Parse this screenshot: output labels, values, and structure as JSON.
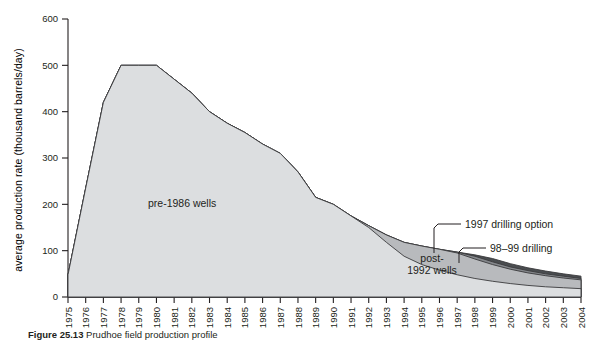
{
  "figure": {
    "caption_bold": "Figure 25.13",
    "caption_rest": "Prudhoe field production profile"
  },
  "chart_data": {
    "type": "area",
    "title": "",
    "xlabel": "",
    "ylabel": "average production rate (thousand barrels/day)",
    "xlim": [
      1975,
      2004
    ],
    "ylim": [
      0,
      600
    ],
    "yticks": [
      0,
      100,
      200,
      300,
      400,
      500,
      600
    ],
    "ytick_labels": [
      "0",
      "100",
      "200",
      "300",
      "400",
      "500",
      "600"
    ],
    "x": [
      1975,
      1976,
      1977,
      1978,
      1979,
      1980,
      1981,
      1982,
      1983,
      1984,
      1985,
      1986,
      1987,
      1988,
      1989,
      1990,
      1991,
      1992,
      1993,
      1994,
      1995,
      1996,
      1997,
      1998,
      1999,
      2000,
      2001,
      2002,
      2003,
      2004
    ],
    "xtick_labels": [
      "1975",
      "1976",
      "1977",
      "1978",
      "1979",
      "1980",
      "1981",
      "1982",
      "1983",
      "1984",
      "1985",
      "1986",
      "1987",
      "1988",
      "1989",
      "1990",
      "1991",
      "1992",
      "1993",
      "1994",
      "1995",
      "1996",
      "1997",
      "1998",
      "1999",
      "2000",
      "2001",
      "2002",
      "2003",
      "2004"
    ],
    "grid": false,
    "legend": "inline-annotations",
    "stacked": true,
    "series": [
      {
        "name": "pre-1986 wells",
        "color": "#dcdee0",
        "values": [
          48,
          235,
          420,
          500,
          500,
          500,
          470,
          440,
          400,
          375,
          355,
          330,
          310,
          270,
          215,
          200,
          175,
          150,
          118,
          88,
          70,
          58,
          48,
          40,
          34,
          29,
          25,
          22,
          20,
          18
        ]
      },
      {
        "name": "post-1992 wells",
        "color": "#b8babd",
        "values": [
          0,
          0,
          0,
          0,
          0,
          0,
          0,
          0,
          0,
          0,
          0,
          0,
          0,
          0,
          0,
          0,
          0,
          4,
          16,
          30,
          40,
          45,
          47,
          42,
          36,
          31,
          27,
          24,
          21,
          19
        ]
      },
      {
        "name": "1997 drilling option",
        "color": "#84878b",
        "values": [
          0,
          0,
          0,
          0,
          0,
          0,
          0,
          0,
          0,
          0,
          0,
          0,
          0,
          0,
          0,
          0,
          0,
          0,
          0,
          0,
          0,
          0,
          2,
          6,
          6,
          5,
          5,
          4,
          4,
          3
        ]
      },
      {
        "name": "98-99 drilling",
        "color": "#4a4d50",
        "values": [
          0,
          0,
          0,
          0,
          0,
          0,
          0,
          0,
          0,
          0,
          0,
          0,
          0,
          0,
          0,
          0,
          0,
          0,
          0,
          0,
          0,
          0,
          0,
          3,
          7,
          7,
          6,
          6,
          5,
          5
        ]
      }
    ],
    "annotations": [
      {
        "name": "pre-1986 wells",
        "text": "pre-1986 wells"
      },
      {
        "name": "post-1992 wells",
        "text_line1": "post-",
        "text_line2": "1992 wells"
      },
      {
        "name": "1997 drilling option",
        "text": "1997 drilling option"
      },
      {
        "name": "98-99 drilling",
        "text": "98–99 drilling"
      }
    ],
    "colors": {
      "band_pre1986": "#dcdee0",
      "band_post1992": "#b8babd",
      "band_1997": "#84878b",
      "band_9899": "#4a4d50",
      "axis": "#231f20",
      "outline": "#3a3a3c",
      "background": "#ffffff"
    }
  }
}
